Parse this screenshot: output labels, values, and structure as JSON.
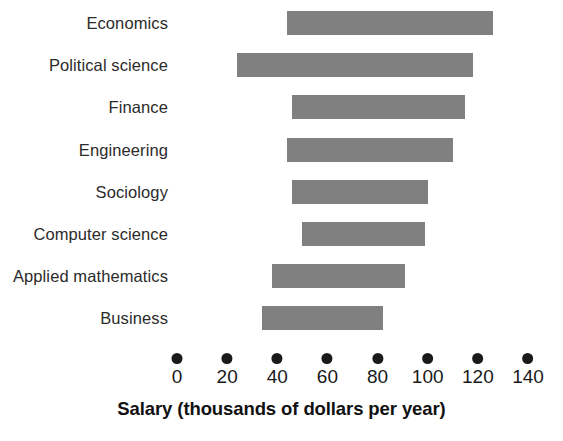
{
  "chart_data": {
    "type": "bar",
    "orientation": "horizontal",
    "title": "",
    "subtitle": "",
    "xlabel": "Salary (thousands of dollars per year)",
    "ylabel": "",
    "categories": [
      "Economics",
      "Political science",
      "Finance",
      "Engineering",
      "Sociology",
      "Computer science",
      "Applied mathematics",
      "Business"
    ],
    "bars": [
      {
        "category": "Economics",
        "start": 44,
        "end": 126
      },
      {
        "category": "Political science",
        "start": 24,
        "end": 118
      },
      {
        "category": "Finance",
        "start": 46,
        "end": 115
      },
      {
        "category": "Engineering",
        "start": 44,
        "end": 110
      },
      {
        "category": "Sociology",
        "start": 46,
        "end": 100
      },
      {
        "category": "Computer science",
        "start": 50,
        "end": 99
      },
      {
        "category": "Applied mathematics",
        "start": 38,
        "end": 91
      },
      {
        "category": "Business",
        "start": 34,
        "end": 82
      }
    ],
    "xticks": [
      0,
      20,
      40,
      60,
      80,
      100,
      120,
      140
    ],
    "xtick_labels": [
      "0",
      "20",
      "40",
      "60",
      "80",
      "100",
      "120",
      "140"
    ],
    "xlim": [
      0,
      140
    ],
    "grid": false,
    "legend": false,
    "bar_color": "#808080",
    "tick_marker": "filled-circle",
    "text_color": "#1a1a1a"
  }
}
